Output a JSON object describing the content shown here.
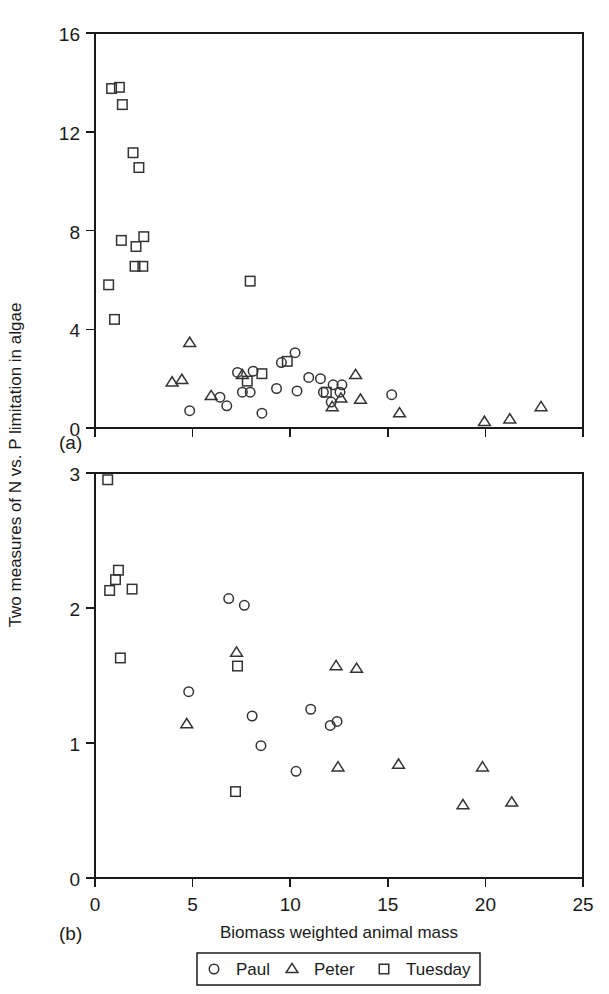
{
  "figure": {
    "ylabel": "Two measures of N vs. P limitation in algae",
    "xlabel": "Biomass weighted animal mass",
    "panel_a_label": "(a)",
    "panel_b_label": "(b)",
    "marker_color": "#333333",
    "axis_color": "#1a1a1a"
  },
  "legend": {
    "position": "below-axis",
    "entries": [
      {
        "label": "Paul",
        "marker": "circle-marker"
      },
      {
        "label": "Peter",
        "marker": "triangle-marker"
      },
      {
        "label": "Tuesday",
        "marker": "square-marker"
      }
    ]
  },
  "chart_data": [
    {
      "type": "scatter",
      "panel": "(a)",
      "title": "",
      "xlabel": "",
      "ylabel": "Two measures of N vs. P limitation in algae",
      "xlim": [
        0,
        25
      ],
      "ylim": [
        0,
        16
      ],
      "xticks": [
        0,
        5,
        10,
        15,
        20,
        25
      ],
      "xticklabels": [
        "",
        "",
        "",
        "",
        "",
        ""
      ],
      "yticks": [
        0,
        4,
        8,
        12,
        16
      ],
      "yticklabels": [
        "0",
        "4",
        "8",
        "12",
        "16"
      ],
      "grid": false,
      "legend": "shared-below",
      "series": [
        {
          "name": "Paul",
          "marker": "circle",
          "points": [
            [
              4.85,
              0.7
            ],
            [
              6.4,
              1.25
            ],
            [
              6.75,
              0.9
            ],
            [
              7.3,
              2.25
            ],
            [
              7.55,
              1.45
            ],
            [
              7.95,
              1.45
            ],
            [
              8.1,
              2.3
            ],
            [
              8.55,
              0.6
            ],
            [
              9.3,
              1.6
            ],
            [
              9.55,
              2.65
            ],
            [
              10.25,
              3.05
            ],
            [
              10.35,
              1.5
            ],
            [
              10.95,
              2.05
            ],
            [
              11.55,
              2.0
            ],
            [
              11.7,
              1.45
            ],
            [
              12.2,
              1.75
            ],
            [
              12.65,
              1.75
            ],
            [
              12.1,
              1.05
            ],
            [
              12.55,
              1.45
            ],
            [
              15.2,
              1.35
            ]
          ]
        },
        {
          "name": "Peter",
          "marker": "triangle",
          "points": [
            [
              3.95,
              1.85
            ],
            [
              4.45,
              1.95
            ],
            [
              4.85,
              3.45
            ],
            [
              5.95,
              1.3
            ],
            [
              7.55,
              2.15
            ],
            [
              12.15,
              0.85
            ],
            [
              12.6,
              1.2
            ],
            [
              13.35,
              2.15
            ],
            [
              13.6,
              1.15
            ],
            [
              15.6,
              0.6
            ],
            [
              19.95,
              0.25
            ],
            [
              21.25,
              0.35
            ],
            [
              22.85,
              0.85
            ]
          ]
        },
        {
          "name": "Tuesday",
          "marker": "square",
          "points": [
            [
              0.7,
              5.8
            ],
            [
              0.85,
              13.75
            ],
            [
              1.0,
              4.4
            ],
            [
              1.25,
              13.8
            ],
            [
              1.35,
              7.6
            ],
            [
              1.4,
              13.1
            ],
            [
              1.95,
              11.15
            ],
            [
              2.05,
              6.55
            ],
            [
              2.1,
              7.35
            ],
            [
              2.25,
              10.55
            ],
            [
              2.45,
              6.55
            ],
            [
              2.5,
              7.75
            ],
            [
              7.95,
              5.95
            ],
            [
              9.85,
              2.7
            ],
            [
              7.8,
              1.9
            ],
            [
              8.55,
              2.2
            ],
            [
              11.85,
              1.45
            ]
          ]
        }
      ]
    },
    {
      "type": "scatter",
      "panel": "(b)",
      "title": "",
      "xlabel": "Biomass weighted animal mass",
      "ylabel": "Two measures of N vs. P limitation in algae",
      "xlim": [
        0,
        25
      ],
      "ylim": [
        0,
        3
      ],
      "xticks": [
        0,
        5,
        10,
        15,
        20,
        25
      ],
      "xticklabels": [
        "0",
        "5",
        "10",
        "15",
        "20",
        "25"
      ],
      "yticks": [
        0,
        1,
        2,
        3
      ],
      "yticklabels": [
        "0",
        "1",
        "2",
        "3"
      ],
      "grid": false,
      "legend": "shared-below",
      "series": [
        {
          "name": "Paul",
          "marker": "circle",
          "points": [
            [
              4.8,
              1.38
            ],
            [
              6.85,
              2.07
            ],
            [
              7.65,
              2.02
            ],
            [
              8.05,
              1.2
            ],
            [
              8.5,
              0.98
            ],
            [
              10.3,
              0.79
            ],
            [
              11.05,
              1.25
            ],
            [
              12.05,
              1.13
            ],
            [
              12.4,
              1.16
            ]
          ]
        },
        {
          "name": "Peter",
          "marker": "triangle",
          "points": [
            [
              4.7,
              1.14
            ],
            [
              7.25,
              1.67
            ],
            [
              12.35,
              1.57
            ],
            [
              13.4,
              1.55
            ],
            [
              12.45,
              0.82
            ],
            [
              15.55,
              0.84
            ],
            [
              19.85,
              0.82
            ],
            [
              18.85,
              0.54
            ],
            [
              21.35,
              0.56
            ]
          ]
        },
        {
          "name": "Tuesday",
          "marker": "square",
          "points": [
            [
              0.65,
              2.95
            ],
            [
              0.75,
              2.13
            ],
            [
              1.05,
              2.21
            ],
            [
              1.2,
              2.28
            ],
            [
              1.9,
              2.14
            ],
            [
              1.3,
              1.63
            ],
            [
              7.3,
              1.57
            ],
            [
              7.2,
              0.64
            ]
          ]
        }
      ]
    }
  ]
}
